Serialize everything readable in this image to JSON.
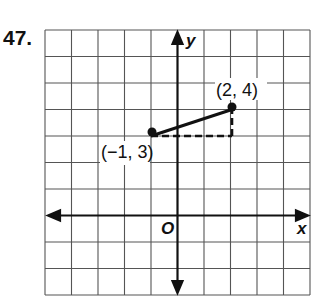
{
  "problem": {
    "number": "47."
  },
  "graph": {
    "x_axis_label": "x",
    "y_axis_label": "y",
    "origin_label": "O",
    "grid": {
      "columns": 10,
      "rows": 10,
      "x_range": [
        -5,
        5
      ],
      "y_range": [
        -3,
        7
      ]
    },
    "points": [
      {
        "label": "(−1, 3)",
        "x": -1,
        "y": 3
      },
      {
        "label": "(2, 4)",
        "x": 2,
        "y": 4
      }
    ],
    "segment": {
      "from": [
        -1,
        3
      ],
      "to": [
        2,
        4
      ],
      "style": "solid"
    },
    "legs": [
      {
        "from": [
          -1,
          3
        ],
        "to": [
          2,
          3
        ],
        "style": "dashed"
      },
      {
        "from": [
          2,
          3
        ],
        "to": [
          2,
          4
        ],
        "style": "dashed"
      }
    ],
    "colors": {
      "ink": "#111111",
      "grid": "#555555",
      "background": "#ffffff"
    }
  }
}
